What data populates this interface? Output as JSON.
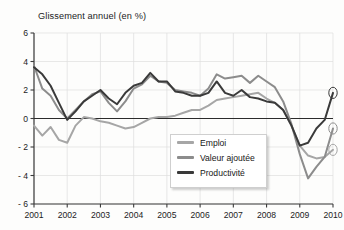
{
  "chart_data": {
    "type": "line",
    "title": "Glissement annuel (en %)",
    "xlabel": "",
    "ylabel": "",
    "ylim": [
      -6,
      6
    ],
    "yticks": [
      6,
      4,
      2,
      0,
      -2,
      -4,
      -6
    ],
    "ytick_labels": [
      "6",
      "4",
      "2",
      "0",
      "- 2",
      "- 4",
      "- 6"
    ],
    "xlim": [
      "2001",
      "2010"
    ],
    "xticks": [
      2001,
      2002,
      2003,
      2004,
      2005,
      2006,
      2007,
      2008,
      2009,
      2010
    ],
    "xtick_labels": [
      "2001",
      "2002",
      "2003",
      "2004",
      "2005",
      "2006",
      "2007",
      "2008",
      "2009",
      "2010"
    ],
    "grid": true,
    "legend_position": "center-right-lower",
    "zero_line": true,
    "end_markers": true,
    "x": [
      2001.0,
      2001.25,
      2001.5,
      2001.75,
      2002.0,
      2002.25,
      2002.5,
      2002.75,
      2003.0,
      2003.25,
      2003.5,
      2003.75,
      2004.0,
      2004.25,
      2004.5,
      2004.75,
      2005.0,
      2005.25,
      2005.5,
      2005.75,
      2006.0,
      2006.25,
      2006.5,
      2006.75,
      2007.0,
      2007.25,
      2007.5,
      2007.75,
      2008.0,
      2008.25,
      2008.5,
      2008.75,
      2009.0,
      2009.25,
      2009.5,
      2009.75,
      2010.0
    ],
    "series": [
      {
        "name": "Emploi",
        "color": "#a6a6a6",
        "values": [
          -0.5,
          -1.2,
          -0.6,
          -1.5,
          -1.7,
          -0.5,
          0.1,
          0.0,
          -0.2,
          -0.3,
          -0.5,
          -0.7,
          -0.6,
          -0.3,
          0.0,
          0.1,
          0.1,
          0.2,
          0.4,
          0.6,
          0.6,
          0.9,
          1.3,
          1.4,
          1.5,
          1.6,
          1.7,
          1.8,
          1.4,
          1.1,
          0.6,
          -0.5,
          -1.9,
          -2.6,
          -2.8,
          -2.7,
          -2.2
        ]
      },
      {
        "name": "Valeur ajoutée",
        "color": "#8c8c8c",
        "values": [
          3.7,
          2.1,
          1.6,
          0.6,
          0.0,
          0.6,
          1.2,
          1.7,
          1.9,
          1.1,
          0.5,
          1.2,
          2.1,
          2.4,
          3.0,
          2.6,
          2.5,
          2.0,
          1.9,
          1.8,
          1.6,
          2.1,
          3.1,
          2.8,
          2.9,
          3.0,
          2.5,
          3.0,
          2.6,
          2.2,
          1.2,
          -0.4,
          -2.5,
          -4.2,
          -3.4,
          -2.7,
          -0.7
        ]
      },
      {
        "name": "Productivité",
        "color": "#3a3a3a",
        "values": [
          3.6,
          3.1,
          2.3,
          1.1,
          -0.1,
          0.5,
          1.2,
          1.6,
          2.0,
          1.4,
          1.0,
          1.8,
          2.3,
          2.5,
          3.2,
          2.6,
          2.6,
          1.9,
          1.8,
          1.6,
          1.6,
          1.8,
          2.6,
          1.8,
          1.6,
          2.0,
          1.5,
          1.4,
          1.2,
          1.1,
          0.6,
          -0.5,
          -1.9,
          -1.7,
          -0.7,
          -0.1,
          1.8
        ]
      }
    ],
    "end_annotations": [
      {
        "series": "Productivité",
        "value": 1.8,
        "marker": "circle-outline"
      },
      {
        "series": "Valeur ajoutée",
        "value": -0.7,
        "marker": "circle-outline"
      },
      {
        "series": "Emploi",
        "value": -2.2,
        "marker": "circle-outline"
      }
    ]
  },
  "legend": {
    "items": [
      {
        "label": "Emploi",
        "color": "#a6a6a6"
      },
      {
        "label": "Valeur ajoutée",
        "color": "#8c8c8c"
      },
      {
        "label": "Productivité",
        "color": "#3a3a3a"
      }
    ]
  },
  "colors": {
    "background": "#fdfdfc",
    "axis": "#3b3b3b",
    "grid": "#dedede",
    "zero_line": "#2b2b2b",
    "text": "#1c1c1c"
  }
}
